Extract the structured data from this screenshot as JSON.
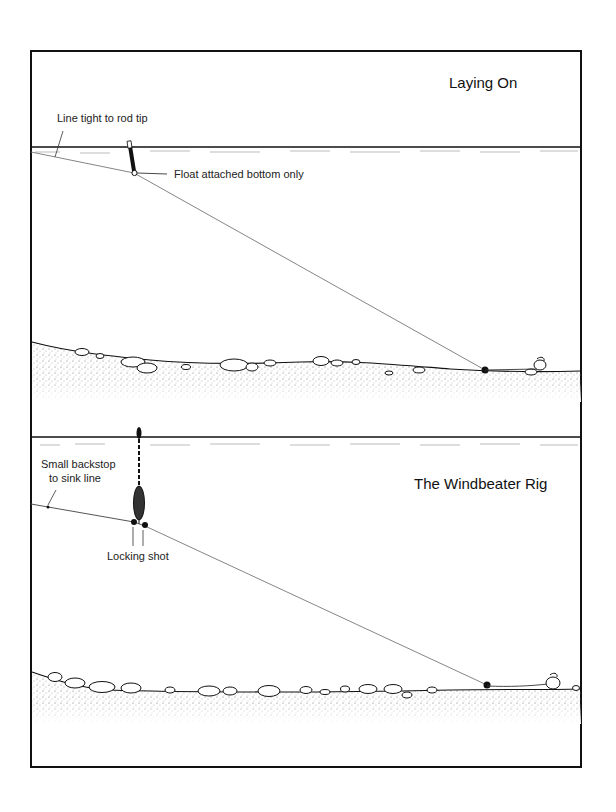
{
  "panels": [
    {
      "id": "laying-on",
      "title": "Laying On",
      "labels": {
        "line_tight": "Line tight to rod tip",
        "float_attached": "Float attached bottom only"
      }
    },
    {
      "id": "windbeater",
      "title": "The Windbeater Rig",
      "labels": {
        "backstop_line1": "Small backstop",
        "backstop_line2": "to sink line",
        "locking_shot": "Locking shot"
      }
    }
  ],
  "colors": {
    "ink": "#111111",
    "line": "#555555",
    "paper": "#ffffff",
    "stipple": "#888888"
  }
}
